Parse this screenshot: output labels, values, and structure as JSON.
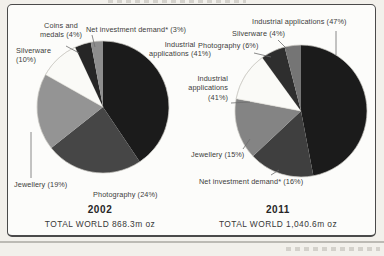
{
  "chart_data": [
    {
      "type": "pie",
      "year": "2002",
      "total": "TOTAL WORLD 868.3m oz",
      "callouts": {
        "coins": "Coins and\nmedals (4%)",
        "net_investment": "Net investment demand* (3%)",
        "silverware": "Silverware\n(10%)",
        "industrial": "Industrial\napplications (41%)",
        "jewellery": "Jewellery (19%)",
        "photography": "Photography (24%)"
      },
      "segments": [
        {
          "label": "Industrial applications",
          "pct": 41,
          "color": "#1b1b1b"
        },
        {
          "label": "Photography",
          "pct": 24,
          "color": "#464646"
        },
        {
          "label": "Jewellery",
          "pct": 19,
          "color": "#949494"
        },
        {
          "label": "Silverware",
          "pct": 10,
          "color": "#fafaf7"
        },
        {
          "label": "Coins and medals",
          "pct": 4,
          "color": "#262626"
        },
        {
          "label": "Net investment demand",
          "pct": 3,
          "color": "#8e8e8e"
        }
      ]
    },
    {
      "type": "pie",
      "year": "2011",
      "total": "TOTAL WORLD 1,040.6m oz",
      "callouts": {
        "industrial": "Industrial applications (47%)",
        "silverware": "Silverware (4%)",
        "photography": "Photography (6%)",
        "industrial_41": "Industrial\napplications\n(41%)",
        "jewellery": "Jewellery (15%)",
        "net_investment": "Net investment demand* (16%)"
      },
      "segments": [
        {
          "label": "Industrial applications",
          "pct": 47,
          "color": "#1b1b1b"
        },
        {
          "label": "Net investment demand",
          "pct": 16,
          "color": "#3f3f3f"
        },
        {
          "label": "Jewellery",
          "pct": 15,
          "color": "#848484"
        },
        {
          "label": "white segment (printed callout reads Industrial applications (41%))",
          "pct": 12,
          "color": "#fafaf7"
        },
        {
          "label": "Photography",
          "pct": 6,
          "color": "#2e2e2e"
        },
        {
          "label": "Silverware",
          "pct": 4,
          "color": "#757575"
        }
      ]
    }
  ]
}
